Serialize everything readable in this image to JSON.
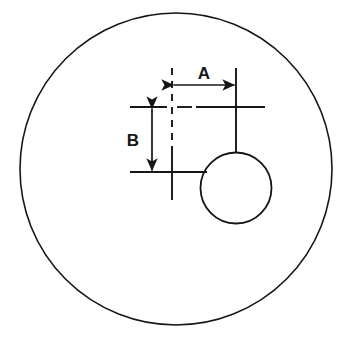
{
  "diagram": {
    "background_color": "#ffffff",
    "line_color": "#161616",
    "labels": {
      "a": "A",
      "b": "B"
    },
    "dimensions": [
      {
        "name": "A",
        "label": "A",
        "orientation": "horizontal",
        "from_x": 172,
        "to_x": 236,
        "y": 85,
        "length_px": 64,
        "arrowheads": "both",
        "label_x": 204,
        "label_y": 73
      },
      {
        "name": "B",
        "label": "B",
        "orientation": "vertical",
        "x": 152,
        "from_y": 107,
        "to_y": 172,
        "length_px": 65,
        "arrowheads": "both",
        "label_x": 133,
        "label_y": 140
      }
    ],
    "shapes": [
      {
        "name": "outer-circle",
        "type": "circle",
        "cx": 176,
        "cy": 169,
        "r": 156,
        "stroke_width": 1.6,
        "fill": "none"
      },
      {
        "name": "hole-circle",
        "type": "circle",
        "cx": 236,
        "cy": 188,
        "r": 35.5,
        "stroke_width": 1.8,
        "fill": "none"
      }
    ],
    "center_lines": [
      {
        "name": "vertical-datum-dashed",
        "orientation": "vertical",
        "x": 172,
        "y1": 68,
        "y2": 150,
        "style": "dashed"
      },
      {
        "name": "vertical-datum-solid",
        "orientation": "vertical",
        "x": 172,
        "y1": 150,
        "y2": 200,
        "style": "solid"
      },
      {
        "name": "upper-horizontal-extension-left",
        "orientation": "horizontal",
        "y": 107,
        "x1": 130,
        "x2": 167,
        "style": "solid"
      },
      {
        "name": "upper-horizontal-dash-segment",
        "orientation": "horizontal",
        "y": 107,
        "x1": 177,
        "x2": 192,
        "style": "dashed"
      },
      {
        "name": "upper-horizontal-extension-right",
        "orientation": "horizontal",
        "y": 107,
        "x1": 196,
        "x2": 265,
        "style": "solid"
      },
      {
        "name": "lower-horizontal-centerline",
        "orientation": "horizontal",
        "y": 172,
        "x1": 130,
        "x2": 207,
        "style": "solid"
      },
      {
        "name": "hole-vertical-centerline",
        "orientation": "vertical",
        "x": 236,
        "y1": 68,
        "y2": 153,
        "style": "solid"
      }
    ]
  }
}
